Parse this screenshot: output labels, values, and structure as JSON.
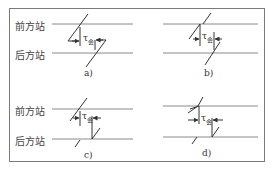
{
  "figure": {
    "station_front": "前方站",
    "station_rear": "后方站",
    "tau_symbol": "τ",
    "tau_subscript": "会",
    "panels": [
      {
        "id": "a",
        "caption": "a)"
      },
      {
        "id": "b",
        "caption": "b)"
      },
      {
        "id": "c",
        "caption": "c)"
      },
      {
        "id": "d",
        "caption": "d)"
      }
    ],
    "colors": {
      "line": "#8a8a8a",
      "stroke": "#333333",
      "frame": "#7a7a7a"
    }
  }
}
